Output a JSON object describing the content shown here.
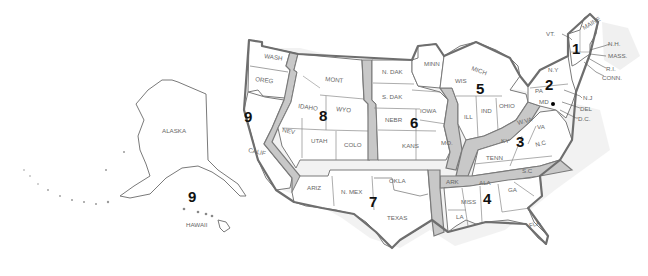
{
  "map": {
    "title": "U.S. Federal Judicial Circuits",
    "circuits": [
      {
        "number": "1",
        "states": [
          "MAINE",
          "N.H.",
          "MASS.",
          "R.I."
        ]
      },
      {
        "number": "2",
        "states": [
          "VT.",
          "N.Y.",
          "CONN."
        ]
      },
      {
        "number": "3",
        "states": [
          "PA.",
          "N.J.",
          "DEL."
        ]
      },
      {
        "number": "4",
        "states": [
          "MD.",
          "W.VA.",
          "VA.",
          "N.C.",
          "S.C."
        ]
      },
      {
        "number": "5",
        "states": [
          "TEXAS",
          "LA.",
          "MISS."
        ]
      },
      {
        "number": "6",
        "states": [
          "MICH.",
          "OHIO",
          "KY.",
          "TENN."
        ]
      },
      {
        "number": "7",
        "states": [
          "WIS.",
          "ILL.",
          "IND."
        ]
      },
      {
        "number": "8",
        "states": [
          "N. DAK.",
          "S. DAK.",
          "NEBR.",
          "MINN.",
          "IOWA",
          "MO.",
          "ARK."
        ]
      },
      {
        "number": "9",
        "states": [
          "WASH.",
          "OREG.",
          "CALIF.",
          "IDAHO",
          "MONT.",
          "NEV.",
          "ARIZ.",
          "ALASKA",
          "HAWAII"
        ]
      },
      {
        "number": "10",
        "states": [
          "WYO.",
          "UTAH",
          "COLO.",
          "KANS.",
          "OKLA.",
          "N. MEX."
        ]
      },
      {
        "number": "11",
        "states": [
          "ALA.",
          "GA.",
          "FLA."
        ]
      }
    ],
    "region_numbers": {
      "r1": "1",
      "r2": "2",
      "r3": "3",
      "r4": "4",
      "r5": "5",
      "r6": "6",
      "r7": "7",
      "r8": "8",
      "r9_main": "9",
      "r9_pacific": "9"
    },
    "labels": {
      "wash": "WASH",
      "oreg": "OREG",
      "calif": "CALIF",
      "idaho": "IDAHO",
      "nev": "NEV",
      "mont": "MONT",
      "wyo": "WYO",
      "utah": "UTAH",
      "colo": "COLO",
      "ariz": "ARIZ",
      "nmex": "N. MEX",
      "ndak": "N. DAK",
      "sdak": "S. DAK",
      "nebr": "NEBR",
      "kans": "KANS",
      "okla": "OKLA",
      "texas": "TEXAS",
      "minn": "MINN",
      "iowa": "IOWA",
      "mo": "MO.",
      "ark": "ARK",
      "la": "LA",
      "wis": "WIS",
      "mich": "MICH",
      "ill": "ILL",
      "ind": "IND",
      "ohio": "OHIO",
      "ky": "KY",
      "tenn": "TENN",
      "wva": "W.VA",
      "va": "VA",
      "nc": "N.C",
      "sc": "S.C",
      "miss": "MISS",
      "ala": "ALA",
      "ga": "GA",
      "fla": "FLA",
      "ny": "N.Y",
      "pa": "PA",
      "md": "MD",
      "maine": "MAINE",
      "vt": "VT.",
      "nh": "N.H.",
      "mass": "MASS.",
      "ri": "R.I.",
      "conn": "CONN.",
      "nj": "N.J",
      "del": "DEL",
      "dc": "D.C.",
      "alaska": "ALASKA",
      "hawaii": "HAWAII"
    }
  }
}
